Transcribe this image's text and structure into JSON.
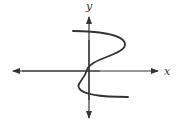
{
  "diagram": {
    "type": "function-graph",
    "axes": {
      "x_label": "x",
      "y_label": "y",
      "x_arrows": "both",
      "y_arrows": "both"
    },
    "colors": {
      "axis": "#333333",
      "curve": "#333333",
      "background": "#ffffff"
    }
  }
}
